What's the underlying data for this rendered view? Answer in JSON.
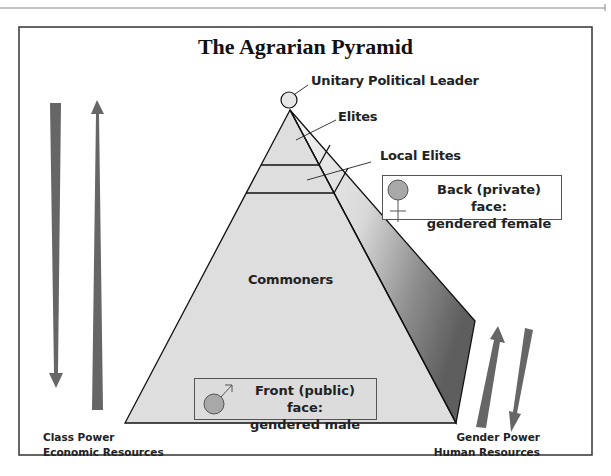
{
  "title": "The Agrarian Pyramid",
  "pyramid": {
    "apex_label": "Unitary Political Leader",
    "tiers": [
      {
        "label": "Elites"
      },
      {
        "label": "Local Elites"
      },
      {
        "label": "Commoners"
      }
    ]
  },
  "legend": {
    "back": {
      "line1": "Back (private) face:",
      "line2": "gendered female",
      "symbol": "female-symbol"
    },
    "front": {
      "line1": "Front (public) face:",
      "line2": "gendered male",
      "symbol": "male-symbol"
    }
  },
  "axes": {
    "left": {
      "line1": "Class Power",
      "line2": "Economic Resources"
    },
    "right": {
      "line1": "Gender Power",
      "line2": "Human Resources"
    }
  },
  "colors": {
    "pyramid_fill": "#dedede",
    "arrow": "#666666",
    "symbol_fill": "#a8a8a8",
    "frame": "#333333"
  }
}
